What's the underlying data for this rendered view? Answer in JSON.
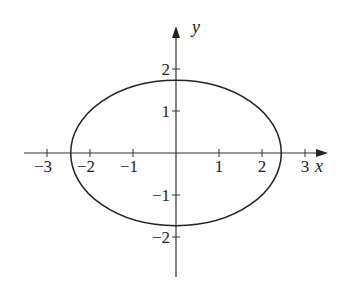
{
  "chart_data": {
    "type": "line",
    "title": "",
    "xlabel": "x",
    "ylabel": "y",
    "xlim": [
      -3.5,
      3.5
    ],
    "ylim": [
      -2.9,
      2.9
    ],
    "grid": false,
    "x_ticks": [
      -3,
      -2,
      -1,
      1,
      2,
      3
    ],
    "x_tick_labels": [
      "−3",
      "−2",
      "−1",
      "1",
      "2",
      "3"
    ],
    "y_ticks": [
      2,
      1,
      -1,
      -2
    ],
    "y_tick_labels": [
      "2",
      "1",
      "−1",
      "−2"
    ],
    "series": [
      {
        "name": "ellipse",
        "shape": "ellipse",
        "center": [
          0,
          0
        ],
        "semi_axis_x": 2.449,
        "semi_axis_y": 1.732,
        "x_intercepts": [
          -2.449,
          2.449
        ],
        "y_intercepts": [
          -1.732,
          1.732
        ],
        "color": "#222222"
      }
    ]
  },
  "layout": {
    "origin_px": [
      176,
      153
    ],
    "x_scale_px": 43,
    "y_scale_px": 42
  }
}
